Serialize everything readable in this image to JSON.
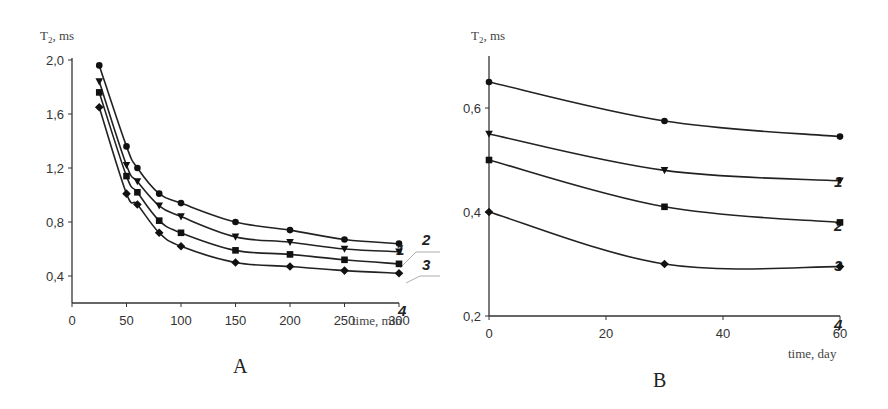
{
  "chart_data": [
    {
      "type": "line",
      "panel_label": "A",
      "title": "",
      "xlabel": "time, min",
      "ylabel": "T2, ms",
      "xlim": [
        0,
        300
      ],
      "ylim": [
        0.2,
        2.0
      ],
      "xticks": [
        "0",
        "50",
        "100",
        "150",
        "200",
        "250",
        "300"
      ],
      "yticks": [
        "0,4",
        "0,8",
        "1,2",
        "1,6",
        "2,0"
      ],
      "grid": false,
      "legend": "inline labels at right end",
      "x": [
        25,
        50,
        60,
        80,
        100,
        150,
        200,
        250,
        300
      ],
      "series": [
        {
          "name": "1",
          "marker": "circle",
          "values": [
            1.96,
            1.36,
            1.2,
            1.01,
            0.94,
            0.8,
            0.74,
            0.67,
            0.64
          ]
        },
        {
          "name": "2",
          "marker": "triangle-down",
          "values": [
            1.84,
            1.22,
            1.1,
            0.92,
            0.84,
            0.69,
            0.65,
            0.6,
            0.58
          ]
        },
        {
          "name": "3",
          "marker": "square",
          "values": [
            1.76,
            1.14,
            1.02,
            0.81,
            0.72,
            0.59,
            0.56,
            0.52,
            0.49
          ]
        },
        {
          "name": "4",
          "marker": "diamond",
          "values": [
            1.65,
            1.01,
            0.93,
            0.72,
            0.62,
            0.5,
            0.47,
            0.44,
            0.42
          ]
        }
      ]
    },
    {
      "type": "line",
      "panel_label": "B",
      "title": "",
      "xlabel": "time, day",
      "ylabel": "T2, ms",
      "xlim": [
        0,
        60
      ],
      "ylim": [
        0.2,
        0.7
      ],
      "xticks": [
        "0",
        "20",
        "40",
        "60"
      ],
      "yticks": [
        "0,2",
        "0,4",
        "0,6"
      ],
      "grid": false,
      "legend": "inline labels below right end",
      "x": [
        0,
        30,
        60
      ],
      "series": [
        {
          "name": "1",
          "marker": "circle",
          "values": [
            0.65,
            0.575,
            0.545
          ]
        },
        {
          "name": "2",
          "marker": "triangle-down",
          "values": [
            0.55,
            0.48,
            0.46
          ]
        },
        {
          "name": "3",
          "marker": "square",
          "values": [
            0.5,
            0.41,
            0.38
          ]
        },
        {
          "name": "4",
          "marker": "diamond",
          "values": [
            0.4,
            0.3,
            0.295
          ]
        }
      ]
    }
  ],
  "labels": {
    "a_ylabel_main": "T",
    "a_ylabel_sub": "2",
    "a_ylabel_unit": ", ms",
    "a_xlabel": "time, min",
    "a_panel": "A",
    "b_ylabel_main": "T",
    "b_ylabel_sub": "2",
    "b_ylabel_unit": ", ms",
    "b_xlabel": "time, day",
    "b_panel": "B"
  }
}
